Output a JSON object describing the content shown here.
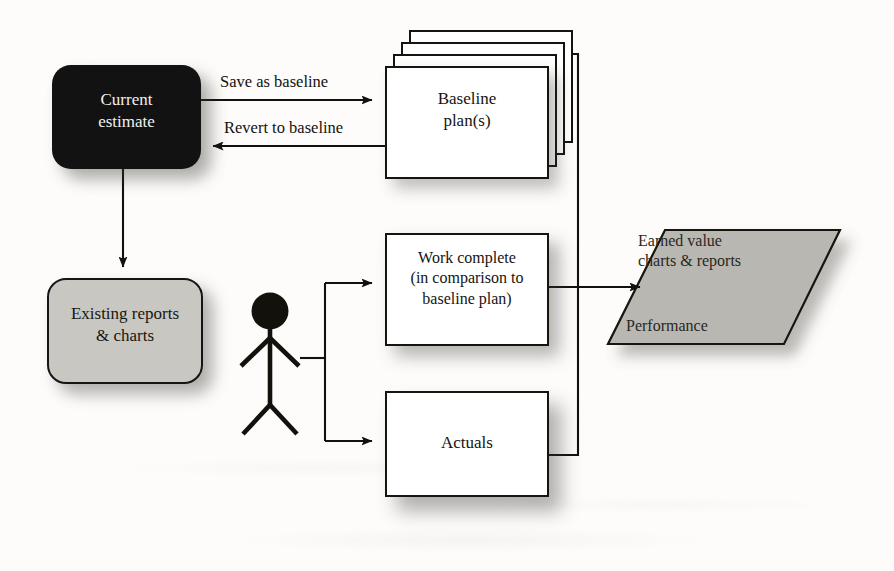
{
  "diagram": {
    "colors": {
      "dark_node_fill": "#121212",
      "dark_node_text": "#f2f1ee",
      "gray_node_fill": "#c9c7c2",
      "parallelogram_fill": "#b9b7b2",
      "white_node_fill": "#ffffff",
      "stroke": "#15140f",
      "page_background": "#fdfcfa"
    },
    "nodes": [
      {
        "id": "current-estimate",
        "label": "Current\nestimate",
        "shape": "rounded-rectangle",
        "fill": "dark"
      },
      {
        "id": "baseline-plans",
        "label": "Baseline\nplan(s)",
        "shape": "stacked-rectangles",
        "stack_count": 4,
        "fill": "white"
      },
      {
        "id": "existing-reports",
        "label": "Existing reports\n& charts",
        "shape": "rounded-rectangle",
        "fill": "gray"
      },
      {
        "id": "work-complete",
        "label": "Work complete\n(in comparison to\nbaseline plan)",
        "shape": "rectangle",
        "fill": "white"
      },
      {
        "id": "actuals",
        "label": "Actuals",
        "shape": "rectangle",
        "fill": "white"
      },
      {
        "id": "earned-value",
        "label": "Earned value\ncharts & reports",
        "secondary_label": "Performance",
        "shape": "parallelogram",
        "fill": "gray"
      },
      {
        "id": "actor",
        "label": "",
        "shape": "stick-figure"
      }
    ],
    "edges": [
      {
        "id": "save-as-baseline",
        "label": "Save as baseline",
        "from": "current-estimate",
        "to": "baseline-plans",
        "direction": "right"
      },
      {
        "id": "revert-to-baseline",
        "label": "Revert to baseline",
        "from": "baseline-plans",
        "to": "current-estimate",
        "direction": "left"
      },
      {
        "id": "current-to-existing",
        "label": "",
        "from": "current-estimate",
        "to": "existing-reports",
        "direction": "down"
      },
      {
        "id": "actor-to-work-complete",
        "label": "",
        "from": "actor",
        "to": "work-complete",
        "direction": "right"
      },
      {
        "id": "actor-to-actuals",
        "label": "",
        "from": "actor",
        "to": "actuals",
        "direction": "right"
      },
      {
        "id": "baseline-to-earned-value",
        "label": "",
        "from": "baseline-plans",
        "to": "earned-value",
        "direction": "right"
      },
      {
        "id": "work-complete-to-earned-value",
        "label": "",
        "from": "work-complete",
        "to": "earned-value",
        "direction": "right"
      },
      {
        "id": "actuals-to-earned-value",
        "label": "",
        "from": "actuals",
        "to": "earned-value",
        "direction": "right"
      }
    ]
  }
}
